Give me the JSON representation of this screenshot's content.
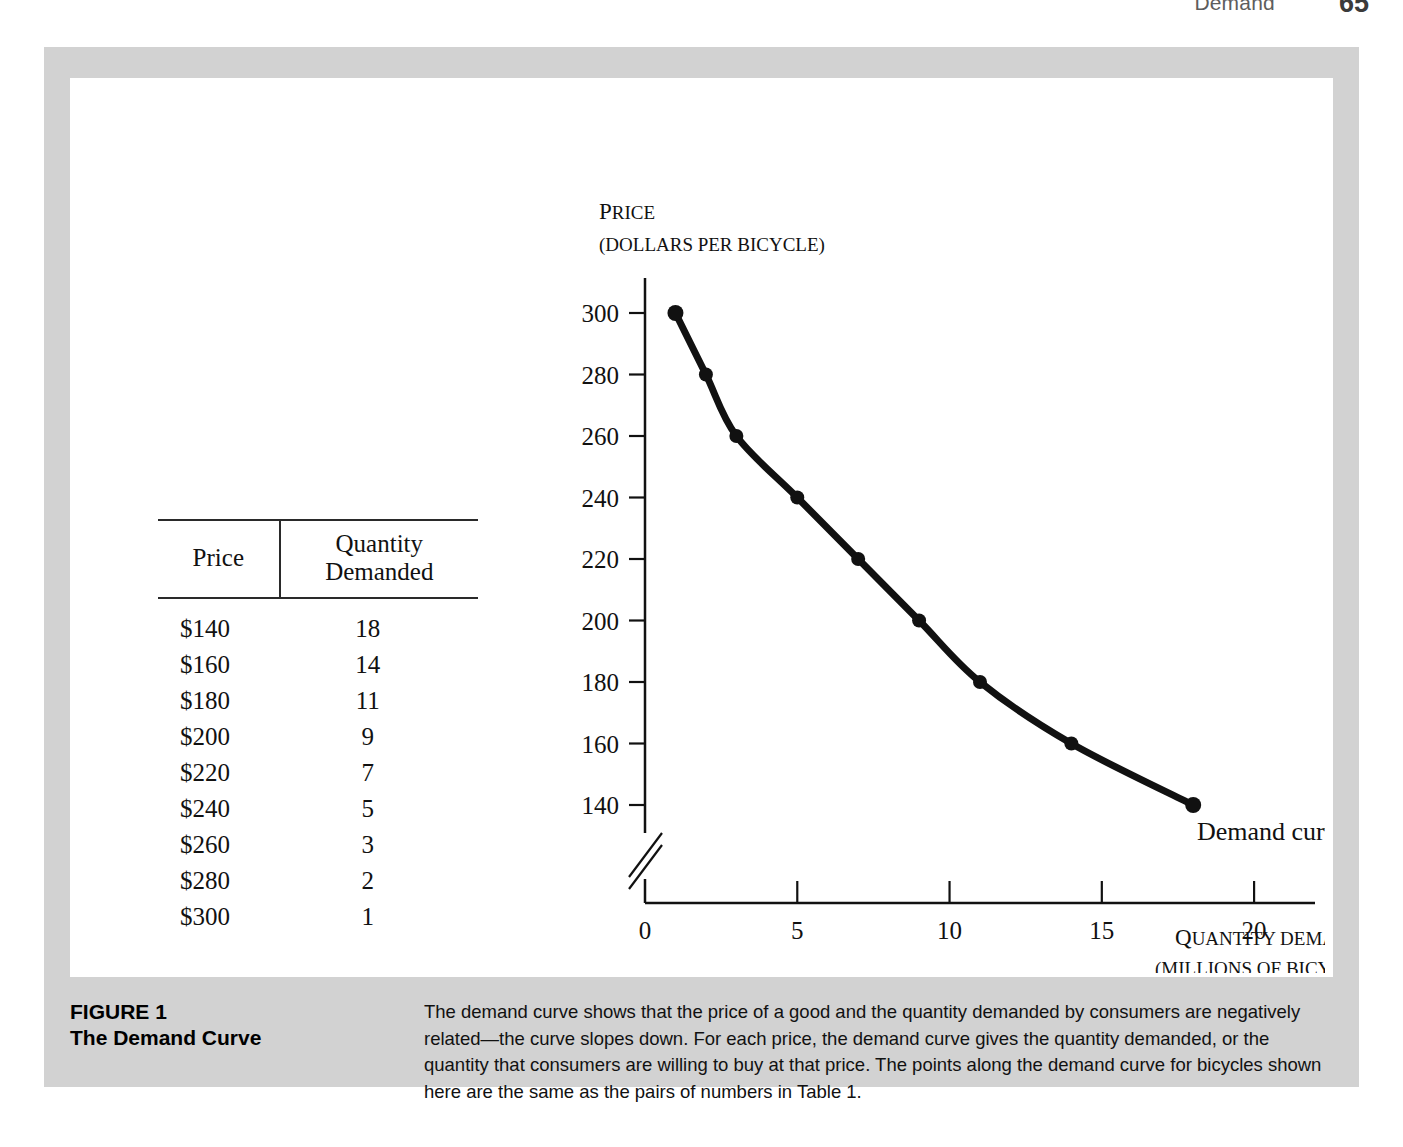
{
  "running_head": {
    "title": "Demand",
    "page_number": "65"
  },
  "figure": {
    "caption_label": "FIGURE 1",
    "caption_title": "The Demand Curve",
    "caption_body": "The demand curve shows that the price of a good and the quantity demanded by consumers are negatively related—the curve slopes down. For each price, the demand curve gives the quantity demanded, or the quantity that consumers are willing to buy at that price. The points along the demand curve for bicycles shown here are the same as the pairs of numbers in Table 1."
  },
  "table": {
    "headers": [
      "Price",
      "Quantity Demanded"
    ],
    "rows": [
      [
        "$140",
        "18"
      ],
      [
        "$160",
        "14"
      ],
      [
        "$180",
        "11"
      ],
      [
        "$200",
        "9"
      ],
      [
        "$220",
        "7"
      ],
      [
        "$240",
        "5"
      ],
      [
        "$260",
        "3"
      ],
      [
        "$280",
        "2"
      ],
      [
        "$300",
        "1"
      ]
    ]
  },
  "chart_data": {
    "type": "line",
    "title": "",
    "ylabel_lead": "P",
    "ylabel_rest": "RICE",
    "ylabel_units": "(DOLLARS PER BICYCLE)",
    "xlabel_lead": "Q",
    "xlabel_rest": "UANTITY DEMANDED",
    "xlabel_units": "(MILLIONS OF BICYCLES)",
    "series_label": "Demand curve",
    "x": [
      1,
      2,
      3,
      5,
      7,
      9,
      11,
      14,
      18
    ],
    "y": [
      300,
      280,
      260,
      240,
      220,
      200,
      180,
      160,
      140
    ],
    "xticks": [
      "0",
      "5",
      "10",
      "15",
      "20"
    ],
    "xtick_values": [
      0,
      5,
      10,
      15,
      20
    ],
    "yticks": [
      "140",
      "160",
      "180",
      "200",
      "220",
      "240",
      "260",
      "280",
      "300"
    ],
    "ytick_values": [
      140,
      160,
      180,
      200,
      220,
      240,
      260,
      280,
      300
    ],
    "xlim": [
      0,
      22
    ],
    "ylim": [
      140,
      300
    ],
    "y_axis_break": true,
    "grid": false,
    "legend": "none",
    "curve_color": "#111111",
    "marker": "circle"
  },
  "colors": {
    "frame": "#d2d2d2",
    "panel": "#ffffff",
    "ink": "#111111"
  }
}
